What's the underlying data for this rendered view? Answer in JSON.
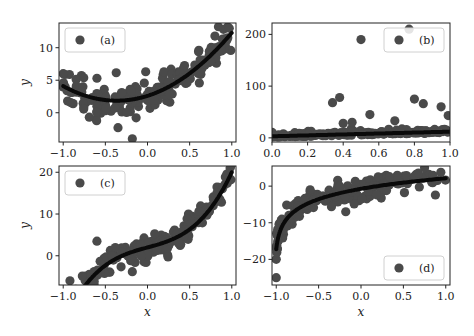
{
  "chart_data": [
    {
      "type": "scatter",
      "panel": "a",
      "legend": "(a)",
      "legend_position": "upper left",
      "xlabel": "",
      "ylabel": "y",
      "xlim": [
        -1.05,
        1.05
      ],
      "ylim": [
        -4.5,
        13.8
      ],
      "xticks": [
        -1.0,
        -0.5,
        0.0,
        0.5,
        1.0
      ],
      "xticklabels": [
        "−1.0",
        "−0.5",
        "0.0",
        "0.5",
        "1.0"
      ],
      "yticks": [
        0,
        5,
        10
      ],
      "yticklabels": [
        "0",
        "5",
        "10"
      ],
      "fit": {
        "form": "quadratic",
        "coeffs": [
          2.6,
          4.1,
          5.6
        ],
        "description": "y = 2.6 + 4.1x + 5.6x^2"
      },
      "outliers": [
        [
          -0.18,
          -4.0
        ],
        [
          -0.35,
          -2.3
        ],
        [
          -0.6,
          5.3
        ],
        [
          -1.0,
          6.0
        ],
        [
          0.97,
          13.0
        ]
      ],
      "noise": 1.3
    },
    {
      "type": "scatter",
      "panel": "b",
      "legend": "(b)",
      "legend_position": "upper right",
      "xlabel": "",
      "ylabel": "",
      "xlim": [
        0.0,
        1.0
      ],
      "ylim": [
        -8,
        222
      ],
      "xticks": [
        0.0,
        0.2,
        0.4,
        0.6,
        0.8,
        1.0
      ],
      "xticklabels": [
        "0.0",
        "0.2",
        "0.4",
        "0.6",
        "0.8",
        "1.0"
      ],
      "yticks": [
        0,
        100,
        200
      ],
      "yticklabels": [
        "0",
        "100",
        "200"
      ],
      "fit": {
        "form": "linear",
        "coeffs": [
          3,
          9
        ],
        "description": "y = 3 + 9x"
      },
      "outliers": [
        [
          0.5,
          190
        ],
        [
          0.77,
          210
        ],
        [
          0.34,
          68
        ],
        [
          0.38,
          78
        ],
        [
          0.55,
          45
        ],
        [
          0.8,
          75
        ],
        [
          0.85,
          66
        ],
        [
          0.95,
          60
        ],
        [
          0.99,
          43
        ],
        [
          0.69,
          33
        ],
        [
          0.4,
          28
        ],
        [
          0.45,
          30
        ]
      ],
      "noise": 5
    },
    {
      "type": "scatter",
      "panel": "c",
      "legend": "(c)",
      "legend_position": "upper left",
      "xlabel": "x",
      "ylabel": "y",
      "xlim": [
        -1.05,
        1.05
      ],
      "ylim": [
        -7,
        21.5
      ],
      "xticks": [
        -1.0,
        -0.5,
        0.0,
        0.5,
        1.0
      ],
      "xticklabels": [
        "−1.0",
        "−0.5",
        "0.0",
        "0.5",
        "1.0"
      ],
      "yticks": [
        0,
        10,
        20
      ],
      "yticklabels": [
        "0",
        "10",
        "20"
      ],
      "fit": {
        "form": "cubic",
        "coeffs": [
          2,
          5.5,
          0,
          12.5
        ],
        "description": "y = 2 + 5.5x + 12.5x^3"
      },
      "outliers": [
        [
          -0.6,
          3.5
        ],
        [
          -0.18,
          -3.8
        ],
        [
          -0.92,
          -6.0
        ],
        [
          0.98,
          21.0
        ]
      ],
      "noise": 1.6
    },
    {
      "type": "scatter",
      "panel": "d",
      "legend": "(d)",
      "legend_position": "lower right",
      "xlabel": "x",
      "ylabel": "",
      "xlim": [
        -1.05,
        1.05
      ],
      "ylim": [
        -27,
        5.5
      ],
      "xticks": [
        -1.0,
        -0.5,
        0.0,
        0.5,
        1.0
      ],
      "xticklabels": [
        "−1.0",
        "−0.5",
        "0.0",
        "0.5",
        "1.0"
      ],
      "yticks": [
        -20,
        -10,
        0
      ],
      "yticklabels": [
        "−20",
        "−10",
        "0"
      ],
      "fit": {
        "form": "log",
        "coeffs": [
          -0.8,
          3.8
        ],
        "description": "y = -0.8 + 3.8 ln(x + 1.0015) shifted"
      },
      "outliers": [
        [
          -0.18,
          -7.0
        ],
        [
          -0.6,
          -1.0
        ],
        [
          0.75,
          5.0
        ],
        [
          -1.0,
          -25.0
        ]
      ],
      "noise": 1.4
    }
  ],
  "style": {
    "marker_color": "#4a4a4a",
    "fit_color": "#0a0a0a",
    "axis_color": "#222222"
  },
  "panels_layout": [
    {
      "left": 59,
      "top": 23,
      "width": 177,
      "height": 119
    },
    {
      "left": 272,
      "top": 23,
      "width": 178,
      "height": 119
    },
    {
      "left": 59,
      "top": 166,
      "width": 177,
      "height": 119
    },
    {
      "left": 272,
      "top": 166,
      "width": 178,
      "height": 119
    }
  ]
}
